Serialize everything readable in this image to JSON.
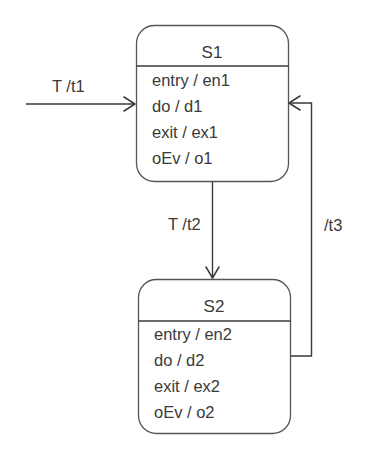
{
  "diagram": {
    "type": "uml-state-machine",
    "states": [
      {
        "id": "S1",
        "name": "S1",
        "actions": [
          "entry / en1",
          "do / d1",
          "exit / ex1",
          "oEv / o1"
        ]
      },
      {
        "id": "S2",
        "name": "S2",
        "actions": [
          "entry / en2",
          "do / d2",
          "exit / ex2",
          "oEv / o2"
        ]
      }
    ],
    "transitions": [
      {
        "id": "initial",
        "from": "",
        "to": "S1",
        "label": "T /t1"
      },
      {
        "id": "s1-to-s2",
        "from": "S1",
        "to": "S2",
        "label": "T /t2"
      },
      {
        "id": "s2-to-s1",
        "from": "S2",
        "to": "S1",
        "label": "/t3"
      }
    ]
  },
  "colors": {
    "line": "#3a3a3a",
    "box_border": "#555555",
    "text": "#3a3a3a",
    "background": "#ffffff"
  }
}
